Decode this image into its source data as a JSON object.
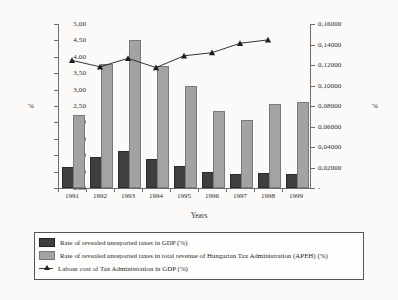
{
  "chart_data": {
    "type": "bar",
    "title": "",
    "xlabel": "Years",
    "ylabel": "%",
    "ylabel_right": "%",
    "categories": [
      "1991",
      "1992",
      "1993",
      "1994",
      "1995",
      "1996",
      "1997",
      "1998",
      "1999"
    ],
    "ylim": [
      0,
      5
    ],
    "ylim_right": [
      0,
      0.16
    ],
    "grid": false,
    "legend_position": "bottom",
    "series": [
      {
        "name": "Rate of revealed unreported taxes in GDP (%)",
        "type": "bar",
        "axis": "left",
        "color": "#3f3f3f",
        "values": [
          0.58,
          0.87,
          1.06,
          0.82,
          0.62,
          0.44,
          0.37,
          0.41,
          0.38
        ]
      },
      {
        "name": "Rate of revealed unreported taxes in total revenue of Hungarian Tax Administration (APEH) (%)",
        "type": "bar",
        "axis": "left",
        "color": "#a3a3a3",
        "values": [
          2.17,
          3.71,
          4.45,
          3.66,
          3.05,
          2.28,
          2.0,
          2.5,
          2.55
        ]
      },
      {
        "name": "Labour cost of Tax Administration in GDP (%)",
        "type": "line",
        "axis": "right",
        "color": "#1e1e1e",
        "marker": "triangle",
        "values": [
          0.1245,
          0.1182,
          0.1265,
          0.1175,
          0.129,
          0.132,
          0.1412,
          0.1445,
          null
        ]
      }
    ],
    "yticks_left": [
      "0,00",
      "0,50",
      "1,00",
      "1,50",
      "2,00",
      "2,50",
      "3,00",
      "3,50",
      "4,00",
      "4,50",
      "5,00"
    ],
    "yticks_right": [
      "-",
      "0,02000",
      "0,04000",
      "0,06000",
      "0,08000",
      "0,10000",
      "0,12000",
      "0,14000",
      "0,16000"
    ]
  },
  "axis": {
    "left_unit": "%",
    "right_unit": "%",
    "x_title": "Years"
  },
  "legend": {
    "items": [
      {
        "swatch": "dark-square-swatch",
        "label": "Rate of revealed unreported taxes in GDP (%)"
      },
      {
        "swatch": "light-square-swatch",
        "label": "Rate of revealed unreported taxes in total revenue of Hungarian Tax Administration (APEH) (%)"
      },
      {
        "swatch": "line-triangle-swatch",
        "label": "Labour cost of Tax Administration in GDP (%)"
      }
    ]
  }
}
